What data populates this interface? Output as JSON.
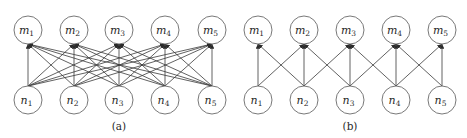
{
  "colors": {
    "stroke": "#3a3a3a",
    "node_stroke": "#6a6a6a",
    "background": "#ffffff",
    "text": "#2a2a2a"
  },
  "node_radius": 14,
  "diagrams": [
    {
      "id": "a",
      "caption": "(a)",
      "caption_pos": [
        119,
        130
      ],
      "connectivity": "full",
      "top_nodes": [
        {
          "base": "m",
          "sub": "1",
          "x": 28,
          "y": 30
        },
        {
          "base": "m",
          "sub": "2",
          "x": 74,
          "y": 30
        },
        {
          "base": "m",
          "sub": "3",
          "x": 119,
          "y": 30
        },
        {
          "base": "m",
          "sub": "4",
          "x": 165,
          "y": 30
        },
        {
          "base": "m",
          "sub": "5",
          "x": 212,
          "y": 30
        }
      ],
      "bottom_nodes": [
        {
          "base": "n",
          "sub": "1",
          "x": 28,
          "y": 100
        },
        {
          "base": "n",
          "sub": "2",
          "x": 74,
          "y": 100
        },
        {
          "base": "n",
          "sub": "3",
          "x": 119,
          "y": 100
        },
        {
          "base": "n",
          "sub": "4",
          "x": 165,
          "y": 100
        },
        {
          "base": "n",
          "sub": "5",
          "x": 212,
          "y": 100
        }
      ]
    },
    {
      "id": "b",
      "caption": "(b)",
      "caption_pos": [
        350,
        130
      ],
      "connectivity": "local",
      "top_nodes": [
        {
          "base": "m",
          "sub": "1",
          "x": 258,
          "y": 30
        },
        {
          "base": "m",
          "sub": "2",
          "x": 304,
          "y": 30
        },
        {
          "base": "m",
          "sub": "3",
          "x": 350,
          "y": 30
        },
        {
          "base": "m",
          "sub": "4",
          "x": 396,
          "y": 30
        },
        {
          "base": "m",
          "sub": "5",
          "x": 442,
          "y": 30
        }
      ],
      "bottom_nodes": [
        {
          "base": "n",
          "sub": "1",
          "x": 258,
          "y": 100
        },
        {
          "base": "n",
          "sub": "2",
          "x": 304,
          "y": 100
        },
        {
          "base": "n",
          "sub": "3",
          "x": 350,
          "y": 100
        },
        {
          "base": "n",
          "sub": "4",
          "x": 396,
          "y": 100
        },
        {
          "base": "n",
          "sub": "5",
          "x": 442,
          "y": 100
        }
      ]
    }
  ]
}
